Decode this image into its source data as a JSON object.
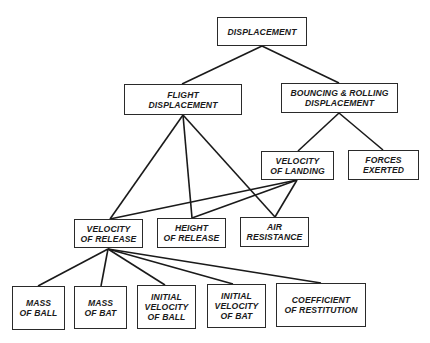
{
  "diagram": {
    "type": "tree",
    "nodes": [
      {
        "id": "displacement",
        "label": "DISPLACEMENT",
        "x": 217,
        "y": 17,
        "w": 90,
        "h": 29
      },
      {
        "id": "flight-displacement",
        "label": "FLIGHT\nDISPLACEMENT",
        "x": 124,
        "y": 84,
        "w": 118,
        "h": 31
      },
      {
        "id": "bouncing-rolling-displacement",
        "label": "BOUNCING & ROLLING\nDISPLACEMENT",
        "x": 281,
        "y": 83,
        "w": 117,
        "h": 30
      },
      {
        "id": "velocity-of-landing",
        "label": "VELOCITY\nOF LANDING",
        "x": 261,
        "y": 151,
        "w": 73,
        "h": 29
      },
      {
        "id": "forces-exerted",
        "label": "FORCES\nEXERTED",
        "x": 348,
        "y": 150,
        "w": 71,
        "h": 30
      },
      {
        "id": "velocity-of-release",
        "label": "VELOCITY\nOF RELEASE",
        "x": 74,
        "y": 219,
        "w": 69,
        "h": 29
      },
      {
        "id": "height-of-release",
        "label": "HEIGHT\nOF RELEASE",
        "x": 157,
        "y": 218,
        "w": 69,
        "h": 30
      },
      {
        "id": "air-resistance",
        "label": "AIR\nRESISTANCE",
        "x": 240,
        "y": 217,
        "w": 69,
        "h": 30
      },
      {
        "id": "mass-of-ball",
        "label": "MASS\nOF BALL",
        "x": 12,
        "y": 286,
        "w": 53,
        "h": 44
      },
      {
        "id": "mass-of-bat",
        "label": "MASS\nOF BAT",
        "x": 74,
        "y": 286,
        "w": 53,
        "h": 43
      },
      {
        "id": "initial-velocity-of-ball",
        "label": "INITIAL\nVELOCITY\nOF BALL",
        "x": 137,
        "y": 285,
        "w": 59,
        "h": 44
      },
      {
        "id": "initial-velocity-of-bat",
        "label": "INITIAL\nVELOCITY\nOF BAT",
        "x": 207,
        "y": 284,
        "w": 59,
        "h": 44
      },
      {
        "id": "coefficient-of-restitution",
        "label": "COEFFICIENT\nOF RESTITUTION",
        "x": 276,
        "y": 283,
        "w": 90,
        "h": 44
      }
    ],
    "edges": [
      {
        "from": "displacement",
        "to": "flight-displacement",
        "x1": 262,
        "y1": 46,
        "x2": 182,
        "y2": 84
      },
      {
        "from": "displacement",
        "to": "bouncing-rolling-displacement",
        "x1": 262,
        "y1": 46,
        "x2": 339,
        "y2": 83
      },
      {
        "from": "flight-displacement",
        "to": "velocity-of-release",
        "x1": 183,
        "y1": 115,
        "x2": 110,
        "y2": 219
      },
      {
        "from": "flight-displacement",
        "to": "height-of-release",
        "x1": 183,
        "y1": 115,
        "x2": 192,
        "y2": 218
      },
      {
        "from": "flight-displacement",
        "to": "air-resistance",
        "x1": 183,
        "y1": 115,
        "x2": 275,
        "y2": 217
      },
      {
        "from": "bouncing-rolling-displacement",
        "to": "velocity-of-landing",
        "x1": 339,
        "y1": 113,
        "x2": 298,
        "y2": 151
      },
      {
        "from": "bouncing-rolling-displacement",
        "to": "forces-exerted",
        "x1": 339,
        "y1": 113,
        "x2": 383,
        "y2": 150
      },
      {
        "from": "velocity-of-landing",
        "to": "velocity-of-release",
        "x1": 297,
        "y1": 180,
        "x2": 110,
        "y2": 219
      },
      {
        "from": "velocity-of-landing",
        "to": "height-of-release",
        "x1": 297,
        "y1": 180,
        "x2": 192,
        "y2": 218
      },
      {
        "from": "velocity-of-landing",
        "to": "air-resistance",
        "x1": 297,
        "y1": 180,
        "x2": 275,
        "y2": 217
      },
      {
        "from": "velocity-of-release",
        "to": "mass-of-ball",
        "x1": 108,
        "y1": 249,
        "x2": 38,
        "y2": 286
      },
      {
        "from": "velocity-of-release",
        "to": "mass-of-bat",
        "x1": 108,
        "y1": 249,
        "x2": 101,
        "y2": 286
      },
      {
        "from": "velocity-of-release",
        "to": "initial-velocity-of-ball",
        "x1": 108,
        "y1": 249,
        "x2": 165,
        "y2": 285
      },
      {
        "from": "velocity-of-release",
        "to": "initial-velocity-of-bat",
        "x1": 108,
        "y1": 249,
        "x2": 233,
        "y2": 284
      },
      {
        "from": "velocity-of-release",
        "to": "coefficient-of-restitution",
        "x1": 108,
        "y1": 249,
        "x2": 321,
        "y2": 283
      }
    ]
  }
}
